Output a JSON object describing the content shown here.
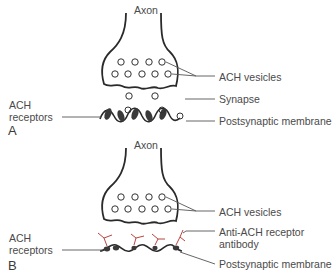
{
  "panels": [
    {
      "id": "A",
      "letter": "A",
      "labels": {
        "axon": "Axon",
        "vesicles": "ACH vesicles",
        "synapse": "Synapse",
        "membrane": "Postsynaptic membrane",
        "receptors_line1": "ACH",
        "receptors_line2": "receptors"
      }
    },
    {
      "id": "B",
      "letter": "B",
      "labels": {
        "axon": "Axon",
        "vesicles": "ACH vesicles",
        "antibody_line1": "Anti-ACH receptor",
        "antibody_line2": "antibody",
        "membrane": "Postsynaptic membrane",
        "receptors_line1": "ACH",
        "receptors_line2": "receptors"
      }
    }
  ],
  "colors": {
    "outline": "#2a2a2a",
    "leader": "#555555",
    "receptor_fill": "#3a3a3a",
    "antibody": "#b0302a"
  }
}
